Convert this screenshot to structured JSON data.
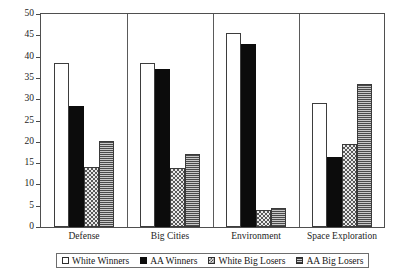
{
  "chart_data": {
    "type": "bar",
    "title": "",
    "subtitle": "",
    "xlabel": "",
    "ylabel": "",
    "ylim": [
      0,
      50
    ],
    "yticks": [
      0,
      5,
      10,
      15,
      20,
      25,
      30,
      35,
      40,
      45,
      50
    ],
    "ytick_labels": [
      "0",
      "5",
      "10",
      "15",
      "20",
      "25",
      "30",
      "35",
      "40",
      "45",
      "50"
    ],
    "grid": false,
    "legend_position": "bottom",
    "categories": [
      "Defense",
      "Big Cities",
      "Environment",
      "Space Exploration"
    ],
    "series": [
      {
        "name": "White Winners",
        "fill": "white-outline",
        "color": "#ffffff",
        "values": [
          38.5,
          38.5,
          45.5,
          29.0
        ]
      },
      {
        "name": "AA Winners",
        "fill": "solid-black",
        "color": "#0c0c0c",
        "values": [
          28.5,
          37.0,
          43.0,
          16.5
        ]
      },
      {
        "name": "White Big Losers",
        "fill": "checkerboard",
        "color": "#9c9c9c",
        "values": [
          14.2,
          13.8,
          4.0,
          19.5
        ]
      },
      {
        "name": "AA Big Losers",
        "fill": "horizontal-lines",
        "color": "#7d7d7d",
        "values": [
          20.1,
          17.2,
          4.5,
          33.5
        ]
      }
    ]
  },
  "legend": {
    "items": [
      {
        "label": "White Winners"
      },
      {
        "label": "AA Winners"
      },
      {
        "label": "White Big Losers"
      },
      {
        "label": "AA Big Losers"
      }
    ]
  }
}
